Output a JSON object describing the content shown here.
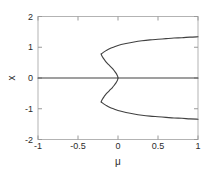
{
  "chart_data": {
    "type": "line",
    "title": "",
    "xlabel": "μ",
    "ylabel": "x",
    "xlim": [
      -1,
      1
    ],
    "ylim": [
      -2,
      2
    ],
    "xticks": [
      -1,
      -0.5,
      0,
      0.5,
      1
    ],
    "xticklabels": [
      "-1",
      "-0.5",
      "0",
      "0.5",
      "1"
    ],
    "yticks": [
      -2,
      -1,
      0,
      1,
      2
    ],
    "yticklabels": [
      "-2",
      "-1",
      "0",
      "1",
      "2"
    ],
    "grid": false,
    "legend": null,
    "line_color": "#404040",
    "axis_color": "#b0b0b0",
    "background": "#ffffff",
    "series": [
      {
        "name": "trivial-branch",
        "comment": "x = 0 for all mu",
        "x": [
          -1,
          -0.75,
          -0.5,
          -0.25,
          0,
          0.25,
          0.5,
          0.75,
          1
        ],
        "y": [
          0,
          0,
          0,
          0,
          0,
          0,
          0,
          0,
          0
        ]
      },
      {
        "name": "upper-branch",
        "comment": "upper half of S-curve, from fold at (-0.21,0.78) rightward/upward and back to origin",
        "x": [
          -0.21,
          -0.2,
          -0.18,
          -0.15,
          -0.1,
          -0.05,
          0.0,
          0.1,
          0.2,
          0.3,
          0.4,
          0.5,
          0.6,
          0.7,
          0.8,
          0.9,
          1.0
        ],
        "y": [
          0.78,
          0.8,
          0.84,
          0.89,
          0.96,
          1.01,
          1.06,
          1.12,
          1.17,
          1.21,
          1.24,
          1.26,
          1.28,
          1.3,
          1.31,
          1.33,
          1.34
        ],
        "yerr": null
      },
      {
        "name": "upper-unstable-branch",
        "comment": "unstable arc from fold at (-0.21,0.78) back to origin (0,0)",
        "x": [
          -0.21,
          -0.205,
          -0.195,
          -0.18,
          -0.16,
          -0.13,
          -0.1,
          -0.07,
          -0.045,
          -0.025,
          -0.012,
          -0.004,
          0.0
        ],
        "y": [
          0.78,
          0.74,
          0.69,
          0.63,
          0.56,
          0.47,
          0.39,
          0.31,
          0.23,
          0.16,
          0.1,
          0.05,
          0.0
        ]
      },
      {
        "name": "lower-branch",
        "comment": "lower half of S-curve, mirror of upper",
        "x": [
          -0.21,
          -0.2,
          -0.18,
          -0.15,
          -0.1,
          -0.05,
          0.0,
          0.1,
          0.2,
          0.3,
          0.4,
          0.5,
          0.6,
          0.7,
          0.8,
          0.9,
          1.0
        ],
        "y": [
          -0.78,
          -0.8,
          -0.84,
          -0.89,
          -0.96,
          -1.01,
          -1.06,
          -1.12,
          -1.17,
          -1.21,
          -1.24,
          -1.26,
          -1.28,
          -1.3,
          -1.31,
          -1.33,
          -1.34
        ]
      },
      {
        "name": "lower-unstable-branch",
        "comment": "unstable arc from lower fold at (-0.21,-0.78) back to origin (0,0)",
        "x": [
          -0.21,
          -0.205,
          -0.195,
          -0.18,
          -0.16,
          -0.13,
          -0.1,
          -0.07,
          -0.045,
          -0.025,
          -0.012,
          -0.004,
          0.0
        ],
        "y": [
          -0.78,
          -0.74,
          -0.69,
          -0.63,
          -0.56,
          -0.47,
          -0.39,
          -0.31,
          -0.23,
          -0.16,
          -0.1,
          -0.05,
          0.0
        ]
      }
    ],
    "fold_points": [
      {
        "x": -0.21,
        "y": 0.78
      },
      {
        "x": -0.21,
        "y": -0.78
      }
    ]
  }
}
